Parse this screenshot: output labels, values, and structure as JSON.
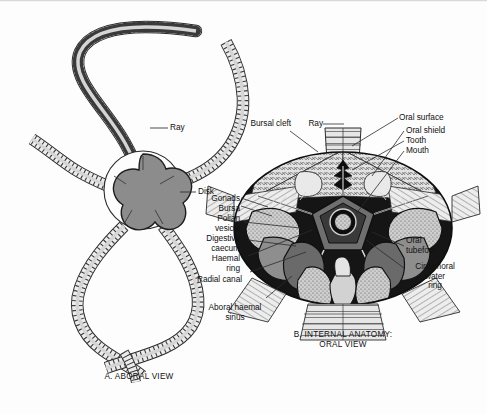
{
  "figure": {
    "background_color": "#fdfdfd",
    "ink_color": "#111111"
  },
  "panel_a": {
    "caption": "A. ABORAL VIEW",
    "labels": [
      {
        "id": "ray",
        "text": "Ray"
      },
      {
        "id": "disk",
        "text": "Disk"
      }
    ],
    "disk_fill": "#8c8c8c",
    "arm_fill": "#e8e8e8",
    "arm_count": 5
  },
  "panel_b": {
    "caption_line1": "B. INTERNAL ANATOMY:",
    "caption_line2": "ORAL VIEW",
    "labels_left": [
      {
        "id": "bursal-cleft",
        "text": "Bursal cleft"
      },
      {
        "id": "gonads",
        "text": "Gonads"
      },
      {
        "id": "bursa",
        "text": "Bursa"
      },
      {
        "id": "polian-vesicle",
        "text": "Polian\nvesicle"
      },
      {
        "id": "digestive-caecum",
        "text": "Digestive\ncaecum"
      },
      {
        "id": "haemal-ring",
        "text": "Haemal\nring"
      },
      {
        "id": "radial-canal",
        "text": "Radial canal"
      },
      {
        "id": "aboral-haemal-sinus",
        "text": "Aboral haemal\nsinus"
      }
    ],
    "labels_top": [
      {
        "id": "ray",
        "text": "Ray"
      }
    ],
    "labels_right": [
      {
        "id": "oral-surface",
        "text": "Oral surface"
      },
      {
        "id": "oral-shield",
        "text": "Oral shield"
      },
      {
        "id": "tooth",
        "text": "Tooth"
      },
      {
        "id": "mouth",
        "text": "Mouth"
      },
      {
        "id": "oral-tubefoot",
        "text": "Oral\ntubefoot"
      },
      {
        "id": "circumoral-water-ring",
        "text": "Circumoral\nwater\nring"
      }
    ],
    "colors": {
      "dark_field": "#121212",
      "mid_gray": "#777777",
      "light_gray": "#d8d8d8",
      "stipple": "#bdbdbd",
      "pale": "#efefef"
    }
  }
}
